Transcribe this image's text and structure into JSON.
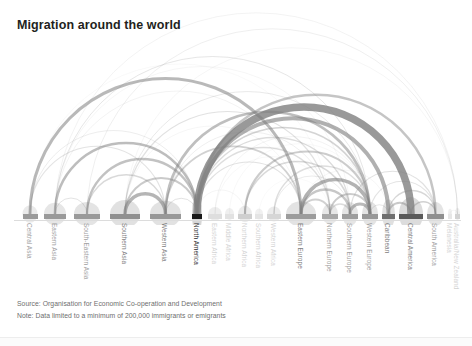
{
  "title": "Migration around the world",
  "footer": {
    "source": "Source: Organisation for Economic Co-operation and Development",
    "note": "Note: Data limited to a minimum of 200,000 immigrants or emigrants"
  },
  "colors": {
    "background": "#ffffff",
    "title_text": "#231f20",
    "label_text": "#8c8c8c",
    "footer_text": "#6e6e6e",
    "arc_stroke": "#808080",
    "node_dark": "#1a1a1a",
    "node_mid": "#9a9a9a",
    "node_light": "#d8d8d8",
    "baseline": "#dcdcdc"
  },
  "chart_data": {
    "type": "arc",
    "title": "Migration around the world",
    "xlabel": "",
    "ylabel": "",
    "grid": false,
    "legend": "none",
    "axis_range_px": [
      14,
      461
    ],
    "value_unit": "migrants",
    "min_threshold": 200000,
    "nodes": [
      {
        "id": "central-asia",
        "label": "Central Asia",
        "x": 22.5,
        "width": 15,
        "weight": 0.3,
        "shade": "#9a9a9a"
      },
      {
        "id": "eastern-asia",
        "label": "Eastern Asia",
        "x": 44.0,
        "width": 22,
        "weight": 0.45,
        "shade": "#9a9a9a"
      },
      {
        "id": "south-eastern-asia",
        "label": "South-Eastern Asia",
        "x": 74.0,
        "width": 26,
        "weight": 0.5,
        "shade": "#9a9a9a"
      },
      {
        "id": "southern-asia",
        "label": "Southern Asia",
        "x": 110.0,
        "width": 30,
        "weight": 0.62,
        "shade": "#909090"
      },
      {
        "id": "western-asia",
        "label": "Western Asia",
        "x": 150.0,
        "width": 31,
        "weight": 0.58,
        "shade": "#989898"
      },
      {
        "id": "north-america",
        "label": "North America",
        "x": 192.0,
        "width": 10,
        "weight": 1.0,
        "shade": "#1a1a1a"
      },
      {
        "id": "eastern-africa",
        "label": "Eastern Africa",
        "x": 208.0,
        "width": 14,
        "weight": 0.18,
        "shade": "#dedede"
      },
      {
        "id": "middle-africa",
        "label": "Middle Africa",
        "x": 225.0,
        "width": 9,
        "weight": 0.12,
        "shade": "#e2e2e2"
      },
      {
        "id": "northern-africa",
        "label": "Northern Africa",
        "x": 238.0,
        "width": 14,
        "weight": 0.26,
        "shade": "#cfcfcf"
      },
      {
        "id": "southern-africa",
        "label": "Southern Africa",
        "x": 255.0,
        "width": 8,
        "weight": 0.1,
        "shade": "#e4e4e4"
      },
      {
        "id": "western-africa",
        "label": "Western Africa",
        "x": 267.0,
        "width": 14,
        "weight": 0.22,
        "shade": "#d6d6d6"
      },
      {
        "id": "eastern-europe",
        "label": "Eastern Europe",
        "x": 286.0,
        "width": 30,
        "weight": 0.55,
        "shade": "#9c9c9c"
      },
      {
        "id": "northern-europe",
        "label": "Northern Europe",
        "x": 322.0,
        "width": 16,
        "weight": 0.4,
        "shade": "#a8a8a8"
      },
      {
        "id": "southern-europe",
        "label": "Southern Europe",
        "x": 342.0,
        "width": 16,
        "weight": 0.48,
        "shade": "#9e9e9e"
      },
      {
        "id": "western-europe",
        "label": "Western Europe",
        "x": 362.0,
        "width": 16,
        "weight": 0.52,
        "shade": "#989898"
      },
      {
        "id": "caribbean",
        "label": "Caribbean",
        "x": 382.0,
        "width": 13,
        "weight": 0.66,
        "shade": "#6f6f6f"
      },
      {
        "id": "central-america",
        "label": "Central America",
        "x": 399.0,
        "width": 24,
        "weight": 0.8,
        "shade": "#5a5a5a"
      },
      {
        "id": "south-america",
        "label": "South America",
        "x": 427.0,
        "width": 17,
        "weight": 0.5,
        "shade": "#8f8f8f"
      },
      {
        "id": "melanesia",
        "label": "Melanesia",
        "x": 448.0,
        "width": 4,
        "weight": 0.08,
        "shade": "#e6e6e6"
      },
      {
        "id": "australia-nz",
        "label": "Australia/New Zealand",
        "x": 455.0,
        "width": 5,
        "weight": 0.14,
        "shade": "#d2d2d2"
      }
    ],
    "links": [
      {
        "source": "central-asia",
        "target": "eastern-europe",
        "value": 2.6,
        "opacity": 0.55,
        "thickness": 3.0
      },
      {
        "source": "central-asia",
        "target": "western-asia",
        "value": 1.0,
        "opacity": 0.22,
        "thickness": 1.1
      },
      {
        "source": "central-asia",
        "target": "north-america",
        "value": 0.7,
        "opacity": 0.18,
        "thickness": 0.8
      },
      {
        "source": "eastern-asia",
        "target": "north-america",
        "value": 2.3,
        "opacity": 0.52,
        "thickness": 2.6
      },
      {
        "source": "eastern-asia",
        "target": "western-europe",
        "value": 0.9,
        "opacity": 0.2,
        "thickness": 1.0
      },
      {
        "source": "eastern-asia",
        "target": "australia-nz",
        "value": 0.6,
        "opacity": 0.14,
        "thickness": 0.7
      },
      {
        "source": "eastern-asia",
        "target": "southern-europe",
        "value": 0.5,
        "opacity": 0.13,
        "thickness": 0.6
      },
      {
        "source": "south-eastern-asia",
        "target": "north-america",
        "value": 2.0,
        "opacity": 0.48,
        "thickness": 2.3
      },
      {
        "source": "south-eastern-asia",
        "target": "western-asia",
        "value": 1.2,
        "opacity": 0.3,
        "thickness": 1.4
      },
      {
        "source": "south-eastern-asia",
        "target": "australia-nz",
        "value": 0.7,
        "opacity": 0.16,
        "thickness": 0.8
      },
      {
        "source": "south-eastern-asia",
        "target": "eastern-asia",
        "value": 0.8,
        "opacity": 0.22,
        "thickness": 1.0
      },
      {
        "source": "southern-asia",
        "target": "western-asia",
        "value": 3.0,
        "opacity": 0.58,
        "thickness": 3.4
      },
      {
        "source": "southern-asia",
        "target": "north-america",
        "value": 1.8,
        "opacity": 0.42,
        "thickness": 2.0
      },
      {
        "source": "southern-asia",
        "target": "northern-europe",
        "value": 1.0,
        "opacity": 0.24,
        "thickness": 1.2
      },
      {
        "source": "southern-asia",
        "target": "western-europe",
        "value": 0.8,
        "opacity": 0.2,
        "thickness": 0.9
      },
      {
        "source": "western-asia",
        "target": "western-europe",
        "value": 2.4,
        "opacity": 0.5,
        "thickness": 2.7
      },
      {
        "source": "western-asia",
        "target": "eastern-europe",
        "value": 1.6,
        "opacity": 0.36,
        "thickness": 1.8
      },
      {
        "source": "western-asia",
        "target": "north-america",
        "value": 0.9,
        "opacity": 0.22,
        "thickness": 1.0
      },
      {
        "source": "north-america",
        "target": "central-america",
        "value": 6.0,
        "opacity": 0.8,
        "thickness": 7.5
      },
      {
        "source": "north-america",
        "target": "caribbean",
        "value": 3.4,
        "opacity": 0.62,
        "thickness": 4.0
      },
      {
        "source": "north-america",
        "target": "south-america",
        "value": 2.2,
        "opacity": 0.46,
        "thickness": 2.5
      },
      {
        "source": "north-america",
        "target": "western-europe",
        "value": 1.5,
        "opacity": 0.34,
        "thickness": 1.7
      },
      {
        "source": "north-america",
        "target": "northern-europe",
        "value": 1.1,
        "opacity": 0.26,
        "thickness": 1.3
      },
      {
        "source": "north-america",
        "target": "eastern-europe",
        "value": 1.0,
        "opacity": 0.24,
        "thickness": 1.2
      },
      {
        "source": "north-america",
        "target": "southern-europe",
        "value": 1.2,
        "opacity": 0.28,
        "thickness": 1.4
      },
      {
        "source": "north-america",
        "target": "northern-africa",
        "value": 0.5,
        "opacity": 0.14,
        "thickness": 0.6
      },
      {
        "source": "eastern-africa",
        "target": "western-europe",
        "value": 0.6,
        "opacity": 0.14,
        "thickness": 0.7
      },
      {
        "source": "eastern-africa",
        "target": "northern-europe",
        "value": 0.4,
        "opacity": 0.11,
        "thickness": 0.5
      },
      {
        "source": "middle-africa",
        "target": "western-europe",
        "value": 0.4,
        "opacity": 0.11,
        "thickness": 0.5
      },
      {
        "source": "northern-africa",
        "target": "western-europe",
        "value": 2.0,
        "opacity": 0.4,
        "thickness": 2.2
      },
      {
        "source": "northern-africa",
        "target": "southern-europe",
        "value": 1.4,
        "opacity": 0.3,
        "thickness": 1.6
      },
      {
        "source": "southern-africa",
        "target": "northern-europe",
        "value": 0.3,
        "opacity": 0.1,
        "thickness": 0.4
      },
      {
        "source": "western-africa",
        "target": "western-europe",
        "value": 1.2,
        "opacity": 0.26,
        "thickness": 1.4
      },
      {
        "source": "western-africa",
        "target": "southern-europe",
        "value": 0.8,
        "opacity": 0.18,
        "thickness": 0.9
      },
      {
        "source": "eastern-europe",
        "target": "western-europe",
        "value": 3.2,
        "opacity": 0.6,
        "thickness": 3.6
      },
      {
        "source": "eastern-europe",
        "target": "southern-europe",
        "value": 2.0,
        "opacity": 0.44,
        "thickness": 2.3
      },
      {
        "source": "eastern-europe",
        "target": "northern-europe",
        "value": 1.6,
        "opacity": 0.36,
        "thickness": 1.8
      },
      {
        "source": "eastern-europe",
        "target": "caribbean",
        "value": 0.5,
        "opacity": 0.12,
        "thickness": 0.6
      },
      {
        "source": "northern-europe",
        "target": "western-europe",
        "value": 1.8,
        "opacity": 0.4,
        "thickness": 2.0
      },
      {
        "source": "northern-europe",
        "target": "southern-europe",
        "value": 1.2,
        "opacity": 0.28,
        "thickness": 1.4
      },
      {
        "source": "southern-europe",
        "target": "western-europe",
        "value": 2.6,
        "opacity": 0.54,
        "thickness": 3.0
      },
      {
        "source": "southern-europe",
        "target": "south-america",
        "value": 1.0,
        "opacity": 0.24,
        "thickness": 1.2
      },
      {
        "source": "western-europe",
        "target": "caribbean",
        "value": 0.8,
        "opacity": 0.2,
        "thickness": 1.0
      },
      {
        "source": "western-europe",
        "target": "south-america",
        "value": 0.9,
        "opacity": 0.22,
        "thickness": 1.1
      },
      {
        "source": "caribbean",
        "target": "central-america",
        "value": 1.4,
        "opacity": 0.42,
        "thickness": 1.8
      },
      {
        "source": "caribbean",
        "target": "south-america",
        "value": 1.0,
        "opacity": 0.32,
        "thickness": 1.3
      },
      {
        "source": "central-america",
        "target": "south-america",
        "value": 1.2,
        "opacity": 0.36,
        "thickness": 1.5
      },
      {
        "source": "melanesia",
        "target": "australia-nz",
        "value": 0.3,
        "opacity": 0.14,
        "thickness": 0.5
      },
      {
        "source": "southern-asia",
        "target": "australia-nz",
        "value": 0.5,
        "opacity": 0.12,
        "thickness": 0.6
      },
      {
        "source": "central-asia",
        "target": "northern-europe",
        "value": 0.4,
        "opacity": 0.1,
        "thickness": 0.5
      },
      {
        "source": "eastern-asia",
        "target": "eastern-europe",
        "value": 0.6,
        "opacity": 0.14,
        "thickness": 0.7
      },
      {
        "source": "western-asia",
        "target": "northern-europe",
        "value": 0.7,
        "opacity": 0.16,
        "thickness": 0.8
      },
      {
        "source": "southern-asia",
        "target": "eastern-europe",
        "value": 0.5,
        "opacity": 0.12,
        "thickness": 0.6
      }
    ]
  }
}
